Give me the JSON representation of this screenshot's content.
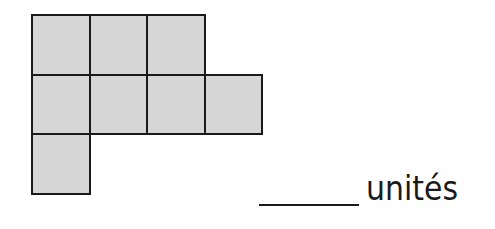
{
  "figure": {
    "cell_size_px": 58,
    "cells": [
      {
        "row": 0,
        "col": 0
      },
      {
        "row": 0,
        "col": 1
      },
      {
        "row": 0,
        "col": 2
      },
      {
        "row": 1,
        "col": 0
      },
      {
        "row": 1,
        "col": 1
      },
      {
        "row": 1,
        "col": 2
      },
      {
        "row": 1,
        "col": 3
      },
      {
        "row": 2,
        "col": 0
      }
    ],
    "fill_color": "#d6d6d6",
    "border_color": "#1a1a1a"
  },
  "answer": {
    "blank": "",
    "unit_label": "unités"
  }
}
